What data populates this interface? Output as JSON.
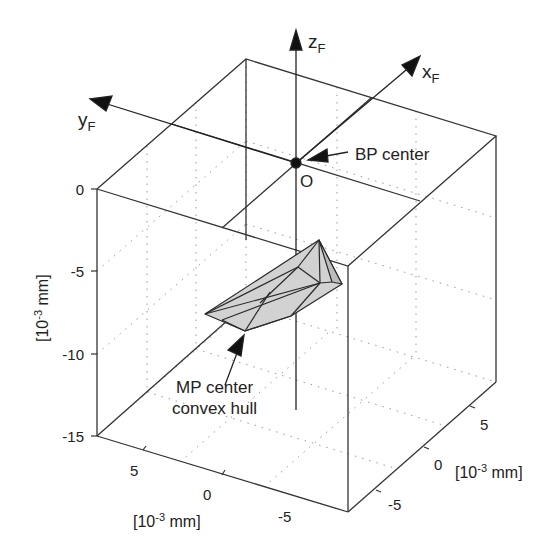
{
  "figure": {
    "type": "3d-box-diagram",
    "colors": {
      "line": "#333333",
      "grid": "#9a9a9a",
      "hull_fill": "#cfcfcf",
      "hull_edge": "#2a2a2a",
      "text": "#222222"
    }
  },
  "axes_frame": {
    "x_axis_label": "x",
    "x_axis_sub": "F",
    "y_axis_label": "y",
    "y_axis_sub": "F",
    "z_axis_label": "z",
    "z_axis_sub": "F",
    "origin_label": "O"
  },
  "annotations": {
    "bp_center": "BP center",
    "mp_center_line1": "MP center",
    "mp_center_line2": "convex hull"
  },
  "ticks": {
    "vertical": [
      "0",
      "-5",
      "-10",
      "-15"
    ],
    "left_depth": [
      "5",
      "0",
      "-5"
    ],
    "right_depth": [
      "5",
      "0",
      "-5"
    ]
  },
  "axis_units": {
    "vertical_pre": "[10",
    "vertical_exp": "-3",
    "vertical_post": " mm]",
    "left_pre": "[10",
    "left_exp": "-3",
    "left_post": " mm]",
    "right_pre": "[10",
    "right_exp": "-3",
    "right_post": " mm]"
  }
}
